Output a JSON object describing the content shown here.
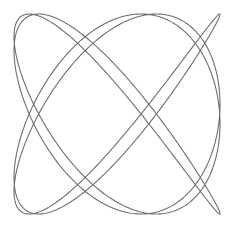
{
  "figure": {
    "width": 236,
    "height": 231,
    "background": "#ffffff",
    "stroke_color": "#6e6e6e"
  },
  "chart_data": {
    "type": "line",
    "title": "",
    "xlabel": "",
    "ylabel": "",
    "curve": {
      "a": 4,
      "b": 5,
      "delta": 0.3927,
      "samples": 1600
    },
    "bounds_px": {
      "x_min": 14,
      "x_max": 220,
      "y_min": 14,
      "y_max": 214
    },
    "axes": "hidden",
    "grid": false,
    "legend": null
  }
}
